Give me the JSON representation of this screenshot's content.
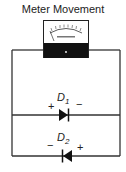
{
  "diagram": {
    "title": "Meter Movement",
    "meter": {
      "label": "meter-movement",
      "dial_text": "DC MILLIAMPERES",
      "terminal_mark": "+"
    },
    "diodes": [
      {
        "name": "D",
        "subscript": "1",
        "left_sign": "+",
        "right_sign": "−",
        "direction": "right"
      },
      {
        "name": "D",
        "subscript": "2",
        "left_sign": "−",
        "right_sign": "+",
        "direction": "left"
      }
    ],
    "colors": {
      "wire": "#333333",
      "meter_body": "#111111",
      "meter_face": "#ffffff"
    }
  }
}
